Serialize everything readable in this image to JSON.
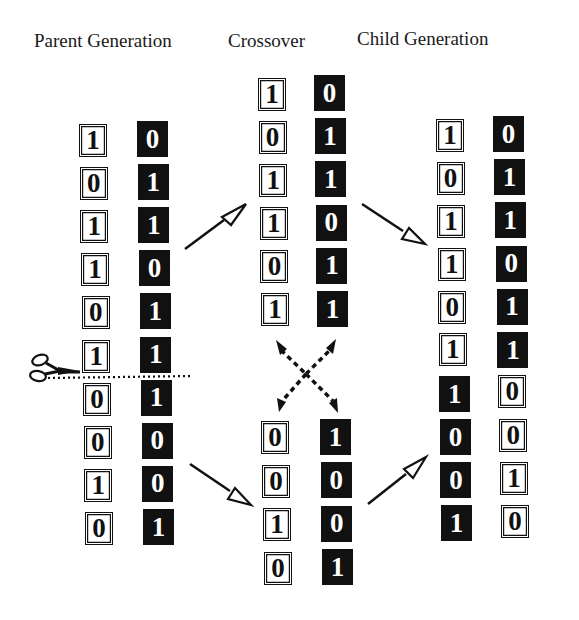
{
  "titles": {
    "parent": "Parent Generation",
    "crossover": "Crossover",
    "child": "Child Generation"
  },
  "parent_generation": {
    "chromosome_a": {
      "color": "white",
      "bits": [
        "1",
        "0",
        "1",
        "1",
        "0",
        "1",
        "0",
        "0",
        "1",
        "0"
      ]
    },
    "chromosome_b": {
      "color": "black",
      "bits": [
        "0",
        "1",
        "1",
        "0",
        "1",
        "1",
        "1",
        "0",
        "0",
        "1"
      ]
    },
    "cut_after_index": 5,
    "cut_icon": "scissors-icon"
  },
  "crossover": {
    "head_segments": {
      "chromosome_a": {
        "color": "white",
        "bits": [
          "1",
          "0",
          "1",
          "1",
          "0",
          "1"
        ]
      },
      "chromosome_b": {
        "color": "black",
        "bits": [
          "0",
          "1",
          "1",
          "0",
          "1",
          "1"
        ]
      }
    },
    "tail_segments": {
      "chromosome_a": {
        "color": "white",
        "bits": [
          "0",
          "0",
          "1",
          "0"
        ]
      },
      "chromosome_b": {
        "color": "black",
        "bits": [
          "1",
          "0",
          "0",
          "1"
        ]
      }
    },
    "swap_icon": "dashed-cross-arrows-icon"
  },
  "child_generation": {
    "chromosome_a": {
      "bits": [
        "1",
        "0",
        "1",
        "1",
        "0",
        "1",
        "1",
        "0",
        "0",
        "1"
      ],
      "colors": [
        "white",
        "white",
        "white",
        "white",
        "white",
        "white",
        "black",
        "black",
        "black",
        "black"
      ]
    },
    "chromosome_b": {
      "bits": [
        "0",
        "1",
        "1",
        "0",
        "1",
        "1",
        "0",
        "0",
        "1",
        "0"
      ],
      "colors": [
        "black",
        "black",
        "black",
        "black",
        "black",
        "black",
        "white",
        "white",
        "white",
        "white"
      ]
    }
  },
  "colors": {
    "ink": "#111111",
    "background": "#ffffff"
  }
}
